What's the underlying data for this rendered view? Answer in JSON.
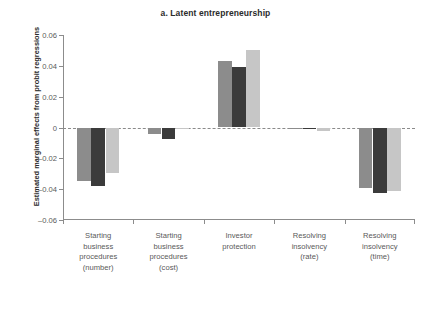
{
  "chart_data": {
    "type": "bar",
    "title": "a. Latent entrepreneurship",
    "xlabel": "",
    "ylabel": "Estimated marginal effects from probit regressions",
    "ylim": [
      -0.06,
      0.06
    ],
    "yticks": [
      0.06,
      0.04,
      0.02,
      0,
      -0.02,
      -0.04,
      -0.06
    ],
    "ytick_labels": [
      "0.06",
      "0.04",
      "0.02",
      "0",
      "–0.02",
      "–0.04",
      "–0.06"
    ],
    "grid": false,
    "zero_reference_line": true,
    "legend": null,
    "categories": [
      "Starting business procedures (number)",
      "Starting business procedures (cost)",
      "Investor protection",
      "Resolving insolvency (rate)",
      "Resolving insolvency (time)"
    ],
    "category_label_lines": [
      [
        "Starting",
        "business",
        "procedures",
        "(number)"
      ],
      [
        "Starting",
        "business",
        "procedures",
        "(cost)"
      ],
      [
        "Investor",
        "protection"
      ],
      [
        "Resolving",
        "insolvency",
        "(rate)"
      ],
      [
        "Resolving",
        "insolvency",
        "(time)"
      ]
    ],
    "series": [
      {
        "name": "series-1",
        "color": "#8c8c8c",
        "values": [
          -0.0345,
          -0.0042,
          0.043,
          -0.0004,
          -0.039
        ]
      },
      {
        "name": "series-2",
        "color": "#3b3b3b",
        "values": [
          -0.0382,
          -0.0072,
          0.0395,
          -0.0003,
          -0.0425
        ]
      },
      {
        "name": "series-3",
        "color": "#c6c6c6",
        "values": [
          -0.0292,
          -0.001,
          0.05,
          -0.0022,
          -0.0412
        ]
      }
    ]
  }
}
